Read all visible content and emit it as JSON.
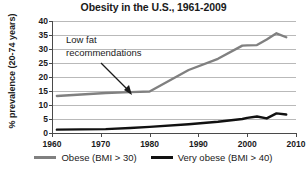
{
  "chart_data": {
    "type": "line",
    "title": "Obesity in the U.S., 1961-2009",
    "xlabel": "",
    "ylabel": "% prevalence (20-74 years)",
    "xlim": [
      1960,
      2010
    ],
    "ylim": [
      0,
      40
    ],
    "grid": true,
    "legend_position": "bottom",
    "xticks": [
      1960,
      1970,
      1980,
      1990,
      2000,
      2010
    ],
    "xtick_labels": [
      "1960",
      "1970",
      "1980",
      "1990",
      "2000",
      "2010"
    ],
    "yticks": [
      0,
      5,
      10,
      15,
      20,
      25,
      30,
      35,
      40
    ],
    "ytick_labels": [
      "0",
      "5",
      "10",
      "15",
      "20",
      "25",
      "30",
      "35",
      "40"
    ],
    "annotations": [
      {
        "text": "Low fat\nrecommendations",
        "points_to_x": 1980,
        "points_to_y": 15
      }
    ],
    "series": [
      {
        "name": "Obese (BMI > 30)",
        "color": "#808080",
        "x": [
          1961,
          1971,
          1976,
          1980,
          1988,
          1994,
          1999,
          2000,
          2002,
          2004,
          2006,
          2008
        ],
        "values": [
          13.2,
          14.3,
          14.6,
          14.8,
          22.5,
          26.5,
          31.2,
          31.3,
          31.4,
          33.4,
          35.6,
          34.2
        ]
      },
      {
        "name": "Very obese (BMI > 40)",
        "color": "#111111",
        "x": [
          1961,
          1971,
          1976,
          1980,
          1988,
          1994,
          1999,
          2000,
          2002,
          2004,
          2006,
          2008
        ],
        "values": [
          1.2,
          1.4,
          1.8,
          2.2,
          3.1,
          4.0,
          5.0,
          5.4,
          5.9,
          5.2,
          7.0,
          6.6
        ]
      }
    ]
  },
  "legend": {
    "items": [
      {
        "label": "Obese (BMI > 30)",
        "color": "#808080"
      },
      {
        "label": "Very obese (BMI > 40)",
        "color": "#111111"
      }
    ]
  }
}
